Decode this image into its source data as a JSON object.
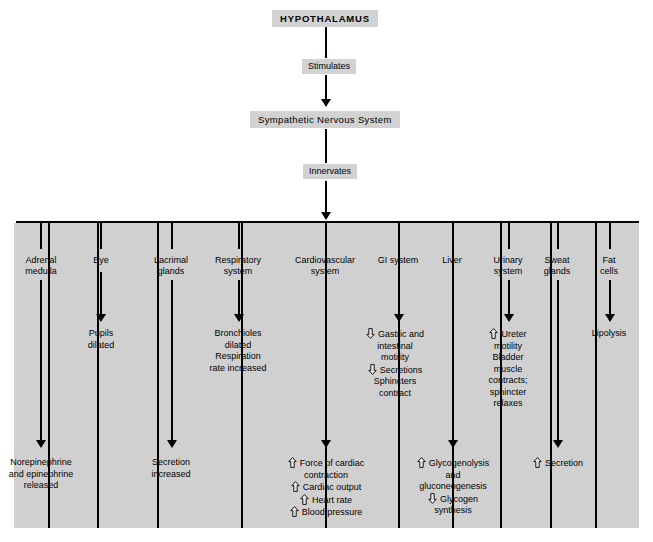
{
  "diagram": {
    "chain": [
      {
        "id": "hypothalamus",
        "label": "HYPOTHALAMUS",
        "type": "node"
      },
      {
        "id": "stimulates",
        "label": "Stimulates",
        "type": "connector"
      },
      {
        "id": "sns",
        "label": "Sympathetic Nervous System",
        "type": "node"
      },
      {
        "id": "innervates",
        "label": "Innervates",
        "type": "connector"
      }
    ],
    "columns": [
      {
        "id": "adrenal-medulla",
        "header_lines": [
          "Adrenal",
          "medulla"
        ],
        "mid": null,
        "bottom": {
          "lines": [
            {
              "text": "Norepinephrine",
              "icon": "none"
            },
            {
              "text": "and epinephrine",
              "icon": "none"
            },
            {
              "text": "released",
              "icon": "none"
            }
          ]
        }
      },
      {
        "id": "eye",
        "header_lines": [
          "Eye"
        ],
        "mid": {
          "lines": [
            {
              "text": "Pupils",
              "icon": "none"
            },
            {
              "text": "dilated",
              "icon": "none"
            }
          ]
        },
        "bottom": null
      },
      {
        "id": "lacrimal-glands",
        "header_lines": [
          "Lacrimal",
          "glands"
        ],
        "mid": null,
        "bottom": {
          "lines": [
            {
              "text": "Secretion",
              "icon": "none"
            },
            {
              "text": "increased",
              "icon": "none"
            }
          ]
        }
      },
      {
        "id": "respiratory-system",
        "header_lines": [
          "Respiratory",
          "system"
        ],
        "mid": {
          "lines": [
            {
              "text": "Bronchioles",
              "icon": "none"
            },
            {
              "text": "dilated",
              "icon": "none"
            },
            {
              "text": "Respiration",
              "icon": "none"
            },
            {
              "text": "rate increased",
              "icon": "none"
            }
          ]
        },
        "bottom": null
      },
      {
        "id": "cardiovascular-system",
        "header_lines": [
          "Cardiovascular",
          "system"
        ],
        "mid": null,
        "bottom": {
          "lines": [
            {
              "text": "Force of cardiac",
              "icon": "up-arrow-icon"
            },
            {
              "text": "contraction",
              "icon": "none"
            },
            {
              "text": "Cardiac output",
              "icon": "up-arrow-icon"
            },
            {
              "text": "Heart rate",
              "icon": "up-arrow-icon"
            },
            {
              "text": "Blood pressure",
              "icon": "up-arrow-icon"
            }
          ]
        }
      },
      {
        "id": "gi-system",
        "header_lines": [
          "GI system"
        ],
        "mid": {
          "lines": [
            {
              "text": "Gastric and",
              "icon": "down-arrow-icon"
            },
            {
              "text": "intestinal",
              "icon": "none"
            },
            {
              "text": "motility",
              "icon": "none"
            },
            {
              "text": "Secretions",
              "icon": "down-arrow-icon"
            },
            {
              "text": "Sphincters",
              "icon": "none"
            },
            {
              "text": "contract",
              "icon": "none"
            }
          ]
        },
        "bottom": null
      },
      {
        "id": "liver",
        "header_lines": [
          "Liver"
        ],
        "mid": null,
        "bottom": {
          "lines": [
            {
              "text": "Glycogenolysis",
              "icon": "up-arrow-icon"
            },
            {
              "text": "and",
              "icon": "none"
            },
            {
              "text": "gluconeogenesis",
              "icon": "none"
            },
            {
              "text": "Glycogen",
              "icon": "down-arrow-icon"
            },
            {
              "text": "synthesis",
              "icon": "none"
            }
          ]
        }
      },
      {
        "id": "urinary-system",
        "header_lines": [
          "Urinary",
          "system"
        ],
        "mid": {
          "lines": [
            {
              "text": "Ureter",
              "icon": "up-arrow-icon"
            },
            {
              "text": "motility",
              "icon": "none"
            },
            {
              "text": "Bladder",
              "icon": "none"
            },
            {
              "text": "muscle",
              "icon": "none"
            },
            {
              "text": "contracts;",
              "icon": "none"
            },
            {
              "text": "sphincter",
              "icon": "none"
            },
            {
              "text": "relaxes",
              "icon": "none"
            }
          ]
        },
        "bottom": null
      },
      {
        "id": "sweat-glands",
        "header_lines": [
          "Sweat",
          "glands"
        ],
        "mid": null,
        "bottom": {
          "lines": [
            {
              "text": "Secretion",
              "icon": "up-arrow-icon"
            }
          ]
        }
      },
      {
        "id": "fat-cells",
        "header_lines": [
          "Fat",
          "cells"
        ],
        "mid": {
          "lines": [
            {
              "text": "Lipolysis",
              "icon": "none"
            }
          ]
        },
        "bottom": null
      }
    ],
    "colors": {
      "panel_background": "#d0d0d0",
      "node_background": "#d2d2d2",
      "line": "#000000",
      "page_background": "#ffffff"
    }
  }
}
